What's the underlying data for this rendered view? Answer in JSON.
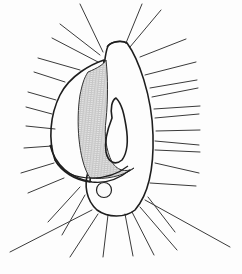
{
  "image": {
    "subject": "ciliate protozoan line drawing",
    "width": 242,
    "height": 274,
    "colors": {
      "background": "#fdfdfd",
      "ink": "#1e1e1e",
      "ray": "#3a3a3a",
      "stipple": "#6a6a6a"
    },
    "rays": [
      [
        80,
        4,
        103,
        52
      ],
      [
        142,
        4,
        126,
        43
      ],
      [
        161,
        10,
        130,
        47
      ],
      [
        60,
        24,
        100,
        55
      ],
      [
        52,
        38,
        98,
        62
      ],
      [
        38,
        58,
        80,
        70
      ],
      [
        34,
        72,
        65,
        82
      ],
      [
        28,
        92,
        56,
        100
      ],
      [
        26,
        107,
        52,
        114
      ],
      [
        26,
        126,
        55,
        129
      ],
      [
        24,
        148,
        52,
        146
      ],
      [
        21,
        173,
        54,
        163
      ],
      [
        28,
        193,
        64,
        178
      ],
      [
        186,
        39,
        140,
        57
      ],
      [
        196,
        62,
        145,
        75
      ],
      [
        197,
        80,
        150,
        88
      ],
      [
        198,
        88,
        152,
        97
      ],
      [
        200,
        106,
        154,
        109
      ],
      [
        199,
        114,
        155,
        118
      ],
      [
        200,
        130,
        156,
        131
      ],
      [
        199,
        145,
        155,
        141
      ],
      [
        200,
        152,
        155,
        150
      ],
      [
        199,
        173,
        155,
        163
      ],
      [
        196,
        186,
        150,
        183
      ],
      [
        48,
        222,
        80,
        187
      ],
      [
        62,
        235,
        85,
        195
      ],
      [
        10,
        252,
        92,
        210
      ],
      [
        70,
        257,
        98,
        214
      ],
      [
        103,
        257,
        108,
        215
      ],
      [
        133,
        256,
        125,
        214
      ],
      [
        154,
        255,
        132,
        212
      ],
      [
        177,
        250,
        140,
        207
      ],
      [
        175,
        232,
        148,
        197
      ],
      [
        230,
        247,
        145,
        200
      ]
    ]
  }
}
